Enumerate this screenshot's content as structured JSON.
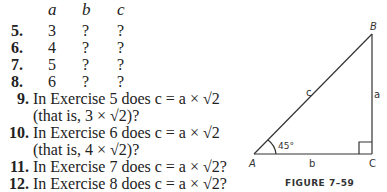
{
  "table": {
    "headers": [
      "a",
      "b",
      "c"
    ],
    "rows": [
      {
        "num": "5.",
        "a": "3",
        "b": "?",
        "c": "?"
      },
      {
        "num": "6.",
        "a": "4",
        "b": "?",
        "c": "?"
      },
      {
        "num": "7.",
        "a": "5",
        "b": "?",
        "c": "?"
      },
      {
        "num": "8.",
        "a": "6",
        "b": "?",
        "c": "?"
      }
    ]
  },
  "exercises": [
    {
      "num": "9.",
      "line1": "In Exercise 5 does c = a × √2",
      "line2": "(that is, 3 × √2)?"
    },
    {
      "num": "10.",
      "line1": "In Exercise 6 does c = a × √2",
      "line2": "(that is, 4 × √2)?"
    },
    {
      "num": "11.",
      "line1": "In Exercise 7 does c = a × √2?"
    },
    {
      "num": "12.",
      "line1": "In Exercise 8 does c = a × √2?"
    }
  ],
  "figure": {
    "caption": "FIGURE 7–59",
    "vertices": {
      "A": "A",
      "B": "B",
      "C": "C"
    },
    "sides": {
      "a": "a",
      "b": "b",
      "c": "c"
    },
    "angle": "45°"
  }
}
